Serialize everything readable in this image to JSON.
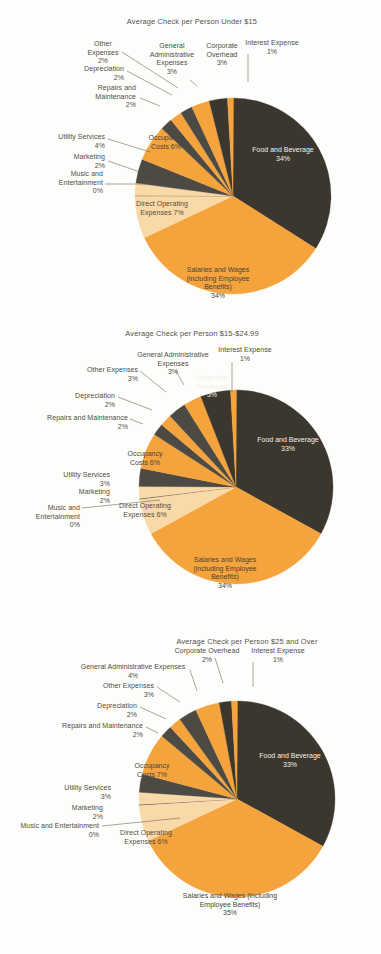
{
  "page": {
    "background": "#fdfdfb",
    "colors": {
      "dark": "#3c372e",
      "orange": "#f5a33c",
      "cream": "#fad9a8",
      "gray_dark": "#4d4a44",
      "text": "#514c45",
      "text_light": "#f2efe9"
    }
  },
  "chart_data": [
    {
      "type": "pie",
      "title": "Average Check per Person Under $15",
      "legend": "none",
      "categories": [
        "Food and Beverage",
        "Salaries and Wages (including Employee Benefits)",
        "Direct Operating Expenses",
        "Music and Entertainment",
        "Marketing",
        "Utility Services",
        "Occupancy Costs",
        "Repairs and Maintenance",
        "Depreciation",
        "Other Expenses",
        "General Administrative Expenses",
        "Corporate Overhead",
        "Interest Expense"
      ],
      "values": [
        34,
        34,
        7,
        0,
        2,
        4,
        6,
        2,
        2,
        2,
        3,
        3,
        1
      ],
      "labels": [
        {
          "name": "Food and Beverage",
          "value": "34%",
          "text": "Food and Beverage\n34%"
        },
        {
          "name": "Salaries and Wages (including Employee Benefits)",
          "value": "34%",
          "text": "Salaries and Wages\n(including Employee\nBenefits)\n34%"
        },
        {
          "name": "Direct Operating Expenses",
          "value": "7%",
          "text": "Direct Operating\nExpenses 7%"
        },
        {
          "name": "Music and Entertainment",
          "value": "0%",
          "text": "Music and\nEntertainment\n0%"
        },
        {
          "name": "Marketing",
          "value": "2%",
          "text": "Marketing\n2%"
        },
        {
          "name": "Utility Services",
          "value": "4%",
          "text": "Utility Services\n4%"
        },
        {
          "name": "Occupancy Costs",
          "value": "6%",
          "text": "Occupancy\nCosts 6%"
        },
        {
          "name": "Repairs and Maintenance",
          "value": "2%",
          "text": "Repairs and\nMaintenance\n2%"
        },
        {
          "name": "Depreciation",
          "value": "2%",
          "text": "Depreciation\n2%"
        },
        {
          "name": "Other Expenses",
          "value": "2%",
          "text": "Other\nExpenses\n2%"
        },
        {
          "name": "General Administrative Expenses",
          "value": "3%",
          "text": "General\nAdministrative\nExpenses\n3%"
        },
        {
          "name": "Corporate Overhead",
          "value": "3%",
          "text": "Corporate\nOverhead\n3%"
        },
        {
          "name": "Interest Expense",
          "value": "1%",
          "text": "Interest Expense\n1%"
        }
      ]
    },
    {
      "type": "pie",
      "title": "Average Check per Person  $15-$24.99",
      "legend": "none",
      "categories": [
        "Food and Beverage",
        "Salaries and Wages (including Employee Benefits)",
        "Direct Operating Expenses",
        "Music and Entertainment",
        "Marketing",
        "Utility Services",
        "Occupancy Costs",
        "Repairs and Maintenance",
        "Depreciation",
        "Other Expenses",
        "General Administrative Expenses",
        "Corporate Overhead",
        "Interest Expense"
      ],
      "values": [
        33,
        34,
        6,
        0,
        2,
        3,
        6,
        2,
        2,
        3,
        3,
        5,
        1
      ],
      "labels": [
        {
          "name": "Food and Beverage",
          "value": "33%",
          "text": "Food and Beverage\n33%"
        },
        {
          "name": "Salaries and Wages (including Employee Benefits)",
          "value": "34%",
          "text": "Salaries and Wages\n(including Employee\nBenefits)\n34%"
        },
        {
          "name": "Direct Operating Expenses",
          "value": "6%",
          "text": "Direct Operating\nExpenses 6%"
        },
        {
          "name": "Music and Entertainment",
          "value": "0%",
          "text": "Music and\nEntertainment\n0%"
        },
        {
          "name": "Marketing",
          "value": "2%",
          "text": "Marketing\n2%"
        },
        {
          "name": "Utility Services",
          "value": "3%",
          "text": "Utility Services\n3%"
        },
        {
          "name": "Occupancy Costs",
          "value": "6%",
          "text": "Occupancy\nCosts 6%"
        },
        {
          "name": "Repairs and Maintenance",
          "value": "2%",
          "text": "Repairs and Maintenance\n2%"
        },
        {
          "name": "Depreciation",
          "value": "2%",
          "text": "Depreciation\n2%"
        },
        {
          "name": "Other Expenses",
          "value": "3%",
          "text": "Other Expenses\n3%"
        },
        {
          "name": "General Administrative Expenses",
          "value": "3%",
          "text": "General Administrative\nExpenses\n3%"
        },
        {
          "name": "Corporate Overhead",
          "value": "5%",
          "text": "Corporate\nOverhead\n5%"
        },
        {
          "name": "Interest Expense",
          "value": "1%",
          "text": "Interest Expense\n1%"
        }
      ]
    },
    {
      "type": "pie",
      "title": "Average Check per Person $25 and Over",
      "legend": "none",
      "categories": [
        "Food and Beverage",
        "Salaries and Wages (including Employee Benefits)",
        "Direct Operating Expenses",
        "Music and Entertainment",
        "Marketing",
        "Utility Services",
        "Occupancy Costs",
        "Repairs and Maintenance",
        "Depreciation",
        "Other Expenses",
        "General Administrative Expenses",
        "Corporate Overhead",
        "Interest Expense"
      ],
      "values": [
        33,
        35,
        6,
        0,
        2,
        3,
        7,
        2,
        2,
        3,
        4,
        2,
        1
      ],
      "labels": [
        {
          "name": "Food and Beverage",
          "value": "33%",
          "text": "Food and Beverage\n33%"
        },
        {
          "name": "Salaries and Wages (including Employee Benefits)",
          "value": "35%",
          "text": "Salaries and Wages (including\nEmployee Benefits)\n35%"
        },
        {
          "name": "Direct Operating Expenses",
          "value": "6%",
          "text": "Direct Operating\nExpenses 6%"
        },
        {
          "name": "Music and Entertainment",
          "value": "0%",
          "text": "Music and Entertainment\n0%"
        },
        {
          "name": "Marketing",
          "value": "2%",
          "text": "Marketing\n2%"
        },
        {
          "name": "Utility Services",
          "value": "3%",
          "text": "Utility Services\n3%"
        },
        {
          "name": "Occupancy Costs",
          "value": "7%",
          "text": "Occupancy\nCosts 7%"
        },
        {
          "name": "Repairs and Maintenance",
          "value": "2%",
          "text": "Repairs and Maintenance\n2%"
        },
        {
          "name": "Depreciation",
          "value": "2%",
          "text": "Depreciation\n2%"
        },
        {
          "name": "Other Expenses",
          "value": "3%",
          "text": "Other Expenses\n3%"
        },
        {
          "name": "General Administrative Expenses",
          "value": "4%",
          "text": "General Administrative Expenses\n4%"
        },
        {
          "name": "Corporate Overhead",
          "value": "2%",
          "text": "Corporate Overhead\n2%"
        },
        {
          "name": "Interest Expense",
          "value": "1%",
          "text": "Interest Expense\n1%"
        }
      ]
    }
  ],
  "layout": [
    {
      "cx": 233,
      "cy": 196,
      "r": 98,
      "title_x": 192,
      "title_y": 24,
      "slice_colors": [
        "dark",
        "orange",
        "cream",
        "gray_dark",
        "cream",
        "gray_dark",
        "orange",
        "gray_dark",
        "orange",
        "gray_dark",
        "orange",
        "dark",
        "orange"
      ],
      "inner": [
        {
          "i": 0,
          "x": 283,
          "y": 152,
          "anchor": "middle",
          "cls": "lbl-in-dark"
        },
        {
          "i": 1,
          "x": 218,
          "y": 272,
          "anchor": "middle",
          "cls": "lbl-in-light"
        },
        {
          "i": 6,
          "x": 166,
          "y": 140,
          "anchor": "middle",
          "cls": "lbl-in-light"
        }
      ],
      "outer": [
        {
          "i": 2,
          "x": 162,
          "y": 206,
          "anchor": "middle",
          "leader": null
        },
        {
          "i": 3,
          "x": 103,
          "y": 176,
          "anchor": "end",
          "leader": [
            [
              105,
              184
            ],
            [
              148,
              184
            ]
          ]
        },
        {
          "i": 4,
          "x": 105,
          "y": 159,
          "anchor": "end",
          "leader": [
            [
              108,
              161
            ],
            [
              140,
              172
            ]
          ]
        },
        {
          "i": 5,
          "x": 105,
          "y": 139,
          "anchor": "end",
          "leader": [
            [
              108,
              139
            ],
            [
              150,
              152
            ]
          ]
        },
        {
          "i": 7,
          "x": 136,
          "y": 90,
          "anchor": "end",
          "leader": [
            [
              140,
              98
            ],
            [
              160,
              106
            ]
          ]
        },
        {
          "i": 8,
          "x": 124,
          "y": 71,
          "anchor": "end",
          "leader": [
            [
              127,
              71
            ],
            [
              172,
              95
            ]
          ]
        },
        {
          "i": 9,
          "x": 103,
          "y": 46,
          "anchor": "middle",
          "leader": [
            [
              122,
              52
            ],
            [
              178,
              88
            ]
          ]
        },
        {
          "i": 10,
          "x": 172,
          "y": 48,
          "anchor": "middle",
          "leader": [
            [
              190,
              80
            ],
            [
              197,
              86
            ]
          ]
        },
        {
          "i": 11,
          "x": 222,
          "y": 48,
          "anchor": "middle",
          "leader": null
        },
        {
          "i": 12,
          "x": 272,
          "y": 45,
          "anchor": "middle",
          "leader": [
            [
              248,
              54
            ],
            [
              248,
              82
            ]
          ]
        }
      ]
    },
    {
      "cx": 236,
      "cy": 487,
      "r": 97,
      "title_x": 192,
      "title_y": 336,
      "slice_colors": [
        "dark",
        "orange",
        "cream",
        "gray_dark",
        "cream",
        "gray_dark",
        "orange",
        "gray_dark",
        "orange",
        "gray_dark",
        "orange",
        "dark",
        "orange"
      ],
      "inner": [
        {
          "i": 0,
          "x": 288,
          "y": 442,
          "anchor": "middle",
          "cls": "lbl-in-dark"
        },
        {
          "i": 1,
          "x": 225,
          "y": 562,
          "anchor": "middle",
          "cls": "lbl-in-light"
        },
        {
          "i": 6,
          "x": 145,
          "y": 456,
          "anchor": "middle",
          "cls": "lbl-in-light"
        },
        {
          "i": 11,
          "x": 212,
          "y": 380,
          "anchor": "middle",
          "cls": "lbl-in-dark"
        }
      ],
      "outer": [
        {
          "i": 2,
          "x": 145,
          "y": 508,
          "anchor": "middle",
          "leader": null
        },
        {
          "i": 3,
          "x": 80,
          "y": 510,
          "anchor": "end",
          "leader": [
            [
              82,
              508
            ],
            [
              160,
              500
            ]
          ]
        },
        {
          "i": 4,
          "x": 110,
          "y": 494,
          "anchor": "end",
          "leader": null
        },
        {
          "i": 5,
          "x": 110,
          "y": 477,
          "anchor": "end",
          "leader": null
        },
        {
          "i": 7,
          "x": 128,
          "y": 420,
          "anchor": "end",
          "leader": [
            [
              130,
              419
            ],
            [
              143,
              424
            ]
          ]
        },
        {
          "i": 8,
          "x": 115,
          "y": 398,
          "anchor": "end",
          "leader": [
            [
              118,
              397
            ],
            [
              152,
              410
            ]
          ]
        },
        {
          "i": 9,
          "x": 138,
          "y": 372,
          "anchor": "end",
          "leader": [
            [
              140,
              371
            ],
            [
              166,
              392
            ]
          ]
        },
        {
          "i": 10,
          "x": 173,
          "y": 357,
          "anchor": "middle",
          "leader": [
            [
              176,
              371
            ],
            [
              184,
              385
            ]
          ]
        },
        {
          "i": 12,
          "x": 245,
          "y": 352,
          "anchor": "middle",
          "leader": [
            [
              232,
              362
            ],
            [
              232,
              392
            ]
          ]
        }
      ]
    },
    {
      "cx": 237,
      "cy": 799,
      "r": 98,
      "title_x": 247,
      "title_y": 644,
      "slice_colors": [
        "dark",
        "orange",
        "cream",
        "gray_dark",
        "cream",
        "gray_dark",
        "orange",
        "gray_dark",
        "orange",
        "gray_dark",
        "orange",
        "dark",
        "orange"
      ],
      "inner": [
        {
          "i": 0,
          "x": 290,
          "y": 758,
          "anchor": "middle",
          "cls": "lbl-in-dark"
        },
        {
          "i": 1,
          "x": 230,
          "y": 898,
          "anchor": "middle",
          "cls": "lbl-in-light"
        },
        {
          "i": 6,
          "x": 152,
          "y": 768,
          "anchor": "middle",
          "cls": "lbl-in-light"
        }
      ],
      "outer": [
        {
          "i": 2,
          "x": 146,
          "y": 835,
          "anchor": "middle",
          "leader": null
        },
        {
          "i": 3,
          "x": 99,
          "y": 828,
          "anchor": "end",
          "leader": [
            [
              102,
              826
            ],
            [
              180,
              818
            ]
          ]
        },
        {
          "i": 4,
          "x": 103,
          "y": 810,
          "anchor": "end",
          "leader": null
        },
        {
          "i": 5,
          "x": 111,
          "y": 790,
          "anchor": "end",
          "leader": null
        },
        {
          "i": 7,
          "x": 143,
          "y": 728,
          "anchor": "end",
          "leader": [
            [
              146,
              727
            ],
            [
              158,
              733
            ]
          ]
        },
        {
          "i": 8,
          "x": 137,
          "y": 708,
          "anchor": "end",
          "leader": [
            [
              140,
              707
            ],
            [
              166,
              719
            ]
          ]
        },
        {
          "i": 9,
          "x": 154,
          "y": 688,
          "anchor": "end",
          "leader": [
            [
              157,
              687
            ],
            [
              180,
              702
            ]
          ]
        },
        {
          "i": 10,
          "x": 133,
          "y": 669,
          "anchor": "middle",
          "leader": [
            [
              190,
              670
            ],
            [
              197,
              691
            ]
          ]
        },
        {
          "i": 11,
          "x": 207,
          "y": 653,
          "anchor": "middle",
          "leader": [
            [
              215,
              658
            ],
            [
              223,
              683
            ]
          ]
        },
        {
          "i": 12,
          "x": 278,
          "y": 653,
          "anchor": "middle",
          "leader": [
            [
              253,
              662
            ],
            [
              253,
              687
            ]
          ]
        }
      ]
    }
  ]
}
